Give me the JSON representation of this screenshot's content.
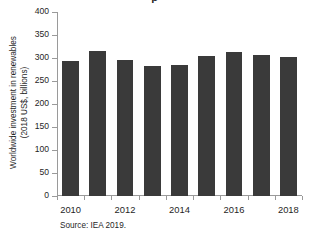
{
  "figure": {
    "source_note": "Source: IEA 2019.",
    "title_clipped": "p"
  },
  "chart_data": {
    "type": "bar",
    "title": "",
    "xlabel": "",
    "ylabel": "Worldwide investment in renewables\n(2018 US$, billions)",
    "categories": [
      "2010",
      "2011",
      "2012",
      "2013",
      "2014",
      "2015",
      "2016",
      "2017",
      "2018"
    ],
    "values": [
      293,
      315,
      295,
      282,
      285,
      305,
      312,
      307,
      303
    ],
    "ylim": [
      0,
      400
    ],
    "yticks": [
      0,
      50,
      100,
      150,
      200,
      250,
      300,
      350,
      400
    ],
    "ytick_labels": [
      "0",
      "50",
      "100",
      "150",
      "200",
      "250",
      "300",
      "350",
      "400"
    ],
    "xtick_labels": [
      "2010",
      "2012",
      "2014",
      "2016",
      "2018"
    ],
    "xtick_indices": [
      0,
      2,
      4,
      6,
      8
    ],
    "grid": false,
    "legend": null,
    "bar_color": "#3a3a3a",
    "axis_color": "#9a9a9a",
    "background": "#ffffff"
  }
}
